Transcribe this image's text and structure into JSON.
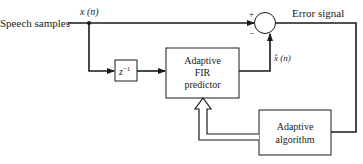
{
  "diagram": {
    "input_label": "Speech samples",
    "signal_x": "x (n)",
    "signal_xhat": "x̂ (n)",
    "error_label": "Error signal",
    "plus_sign": "+",
    "minus_sign": "−",
    "delay_block": {
      "base": "z",
      "exp": "−1"
    },
    "fir_block": {
      "line1": "Adaptive",
      "line2": "FIR",
      "line3": "predictor"
    },
    "algo_block": {
      "line1": "Adaptive",
      "line2": "algorithm"
    },
    "colors": {
      "line": "#1a1a1a",
      "background": "#ffffff"
    }
  }
}
